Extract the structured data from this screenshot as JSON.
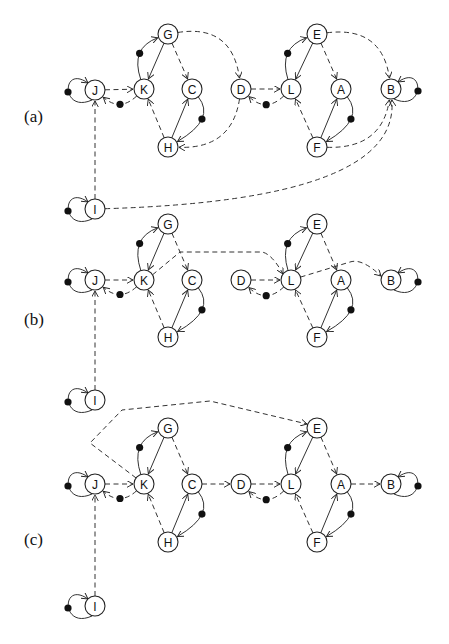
{
  "figure": {
    "panels": [
      {
        "label": "(a)",
        "label_pos": [
          24,
          122
        ],
        "nodes": {
          "J": [
            95,
            90
          ],
          "K": [
            144,
            89
          ],
          "G": [
            168,
            34
          ],
          "C": [
            192,
            89
          ],
          "H": [
            168,
            147
          ],
          "D": [
            241,
            89
          ],
          "L": [
            291,
            89
          ],
          "E": [
            317,
            34
          ],
          "A": [
            341,
            89
          ],
          "F": [
            317,
            147
          ],
          "B": [
            391,
            89
          ],
          "I": [
            95,
            209
          ]
        }
      },
      {
        "label": "(b)",
        "label_pos": [
          24,
          325
        ],
        "nodes": {
          "G": [
            168,
            224
          ],
          "J": [
            95,
            280
          ],
          "K": [
            144,
            280
          ],
          "C": [
            192,
            280
          ],
          "H": [
            168,
            337
          ],
          "D": [
            241,
            280
          ],
          "L": [
            291,
            280
          ],
          "E": [
            317,
            224
          ],
          "A": [
            341,
            280
          ],
          "F": [
            317,
            337
          ],
          "B": [
            391,
            280
          ],
          "I": [
            95,
            400
          ]
        }
      },
      {
        "label": "(c)",
        "label_pos": [
          24,
          545
        ],
        "nodes": {
          "G": [
            168,
            428
          ],
          "J": [
            95,
            484
          ],
          "K": [
            144,
            484
          ],
          "C": [
            192,
            484
          ],
          "H": [
            168,
            542
          ],
          "D": [
            241,
            484
          ],
          "L": [
            291,
            484
          ],
          "E": [
            317,
            428
          ],
          "A": [
            341,
            484
          ],
          "F": [
            317,
            542
          ],
          "B": [
            391,
            484
          ],
          "I": [
            95,
            606
          ]
        }
      }
    ],
    "node_labels": [
      "A",
      "B",
      "C",
      "D",
      "E",
      "F",
      "G",
      "H",
      "I",
      "J",
      "K",
      "L"
    ]
  }
}
